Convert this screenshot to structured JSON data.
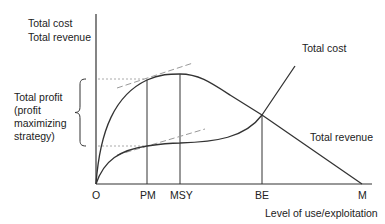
{
  "diagram": {
    "type": "economic-curve-diagram",
    "y_axis_label_line1": "Total cost",
    "y_axis_label_line2": "Total revenue",
    "x_axis_label": "Level of use/exploitation",
    "origin_label": "O",
    "x_ticks": [
      {
        "label": "PM",
        "meaning": "profit maximizing"
      },
      {
        "label": "MSY",
        "meaning": "maximum sustainable yield"
      },
      {
        "label": "BE",
        "meaning": "break-even"
      },
      {
        "label": "M"
      }
    ],
    "curves": [
      {
        "name": "Total cost",
        "shape": "rises steeply, flattens, then rises steeply past BE"
      },
      {
        "name": "Total revenue",
        "shape": "rises to peak at MSY, declines to zero at M"
      }
    ],
    "brace_label_line1": "Total profit",
    "brace_label_line2": "(profit",
    "brace_label_line3": "maximizing",
    "brace_label_line4": "strategy)",
    "colors": {
      "line": "#333333",
      "dashed": "#999999",
      "background": "#ffffff"
    }
  }
}
